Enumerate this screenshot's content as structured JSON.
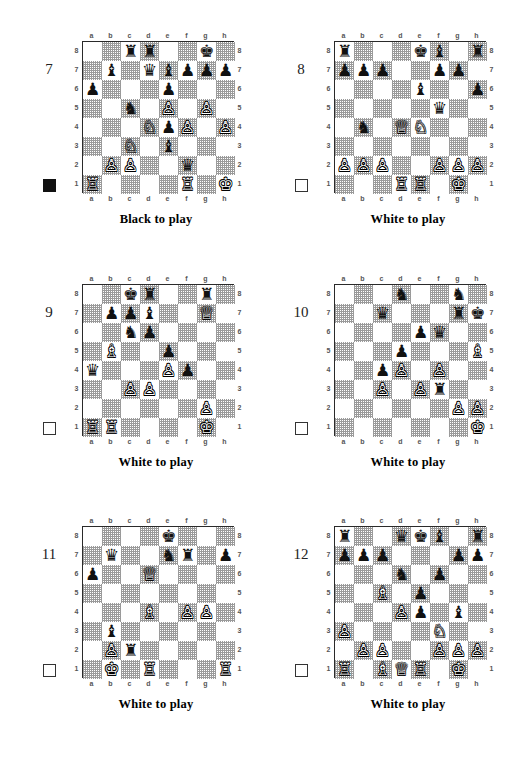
{
  "page": {
    "files": [
      "a",
      "b",
      "c",
      "d",
      "e",
      "f",
      "g",
      "h"
    ],
    "ranks": [
      "8",
      "7",
      "6",
      "5",
      "4",
      "3",
      "2",
      "1"
    ],
    "piece_glyphs": {
      "wK": "♔",
      "wQ": "♕",
      "wR": "♖",
      "wB": "♗",
      "wN": "♘",
      "wP": "♙",
      "bK": "♚",
      "bQ": "♛",
      "bR": "♜",
      "bB": "♝",
      "bN": "♞",
      "bP": "♟"
    },
    "colors": {
      "light_square": "#ffffff",
      "dark_square": "#9a9a9a",
      "border": "#2a2a2a",
      "text": "#000000"
    }
  },
  "diagrams": [
    {
      "number": "7",
      "caption": "Black to play",
      "turn": "black",
      "turn_indicator": "filled-black-square",
      "position": [
        [
          "",
          "",
          "bR",
          "bR",
          "",
          "",
          "bK",
          ""
        ],
        [
          "",
          "bB",
          "",
          "bQ",
          "bB",
          "bP",
          "bP",
          "bP"
        ],
        [
          "bP",
          "",
          "",
          "",
          "bP",
          "",
          "",
          ""
        ],
        [
          "",
          "",
          "bN",
          "",
          "wP",
          "",
          "wP",
          ""
        ],
        [
          "",
          "",
          "",
          "wN",
          "bP",
          "wP",
          "",
          "wP"
        ],
        [
          "",
          "",
          "wN",
          "",
          "bB",
          "",
          "",
          ""
        ],
        [
          "",
          "wP",
          "wP",
          "",
          "",
          "bQ",
          "",
          ""
        ],
        [
          "wR",
          "",
          "",
          "",
          "",
          "wR",
          "",
          "wK"
        ]
      ]
    },
    {
      "number": "8",
      "caption": "White to play",
      "turn": "white",
      "turn_indicator": "empty-white-square",
      "position": [
        [
          "bR",
          "",
          "",
          "",
          "bK",
          "bB",
          "",
          "bR"
        ],
        [
          "bP",
          "bP",
          "bP",
          "",
          "",
          "bP",
          "bP",
          ""
        ],
        [
          "",
          "",
          "",
          "",
          "bB",
          "",
          "",
          "bP"
        ],
        [
          "",
          "",
          "",
          "",
          "",
          "bQ",
          "",
          ""
        ],
        [
          "",
          "bN",
          "",
          "wQ",
          "wN",
          "",
          "",
          ""
        ],
        [
          "",
          "",
          "",
          "",
          "",
          "",
          "",
          ""
        ],
        [
          "wP",
          "wP",
          "wP",
          "",
          "",
          "wP",
          "wP",
          "wP"
        ],
        [
          "",
          "",
          "",
          "wR",
          "wR",
          "",
          "wK",
          ""
        ]
      ]
    },
    {
      "number": "9",
      "caption": "White to play",
      "turn": "white",
      "turn_indicator": "empty-white-square",
      "position": [
        [
          "",
          "",
          "bK",
          "bR",
          "",
          "",
          "bR",
          ""
        ],
        [
          "",
          "bP",
          "bP",
          "bB",
          "",
          "",
          "wQ",
          ""
        ],
        [
          "",
          "",
          "bN",
          "bP",
          "",
          "",
          "",
          ""
        ],
        [
          "",
          "wB",
          "",
          "",
          "bP",
          "",
          "",
          ""
        ],
        [
          "bQ",
          "",
          "",
          "",
          "wP",
          "bP",
          "",
          ""
        ],
        [
          "",
          "",
          "wP",
          "wP",
          "",
          "",
          "",
          ""
        ],
        [
          "",
          "",
          "",
          "",
          "",
          "",
          "wP",
          ""
        ],
        [
          "wR",
          "wR",
          "",
          "",
          "",
          "",
          "wK",
          ""
        ]
      ]
    },
    {
      "number": "10",
      "caption": "White to play",
      "turn": "white",
      "turn_indicator": "empty-white-square",
      "position": [
        [
          "",
          "",
          "",
          "bN",
          "",
          "",
          "bN",
          ""
        ],
        [
          "",
          "",
          "bQ",
          "",
          "",
          "",
          "bR",
          "bK"
        ],
        [
          "",
          "",
          "",
          "",
          "bP",
          "bQ",
          "",
          ""
        ],
        [
          "",
          "",
          "",
          "bP",
          "",
          "",
          "",
          "wB"
        ],
        [
          "",
          "",
          "bP",
          "wP",
          "",
          "wP",
          "",
          ""
        ],
        [
          "",
          "",
          "wP",
          "",
          "wP",
          "bR",
          "",
          ""
        ],
        [
          "",
          "",
          "",
          "",
          "",
          "",
          "wP",
          "wP"
        ],
        [
          "",
          "",
          "",
          "",
          "",
          "",
          "",
          "wK"
        ]
      ]
    },
    {
      "number": "11",
      "caption": "White to play",
      "turn": "white",
      "turn_indicator": "empty-white-square",
      "position": [
        [
          "",
          "",
          "",
          "",
          "bK",
          "",
          "",
          ""
        ],
        [
          "",
          "bQ",
          "",
          "",
          "bN",
          "bR",
          "",
          "bP"
        ],
        [
          "bP",
          "",
          "",
          "wQ",
          "",
          "",
          "",
          ""
        ],
        [
          "",
          "",
          "",
          "",
          "",
          "",
          "",
          ""
        ],
        [
          "",
          "",
          "",
          "wB",
          "",
          "wP",
          "wP",
          ""
        ],
        [
          "",
          "bB",
          "",
          "",
          "",
          "",
          "",
          ""
        ],
        [
          "",
          "wP",
          "bR",
          "",
          "",
          "",
          "",
          ""
        ],
        [
          "",
          "wK",
          "",
          "wR",
          "",
          "",
          "",
          "wR"
        ]
      ]
    },
    {
      "number": "12",
      "caption": "White to play",
      "turn": "white",
      "turn_indicator": "empty-white-square",
      "position": [
        [
          "bR",
          "",
          "",
          "bQ",
          "bK",
          "bB",
          "",
          "bR"
        ],
        [
          "bP",
          "bP",
          "bP",
          "",
          "",
          "",
          "bP",
          "bP"
        ],
        [
          "",
          "",
          "",
          "bN",
          "",
          "bP",
          "",
          ""
        ],
        [
          "",
          "",
          "wB",
          "",
          "bP",
          "",
          "",
          ""
        ],
        [
          "",
          "",
          "",
          "wP",
          "bP",
          "",
          "bB",
          ""
        ],
        [
          "wP",
          "",
          "",
          "",
          "",
          "wN",
          "",
          ""
        ],
        [
          "",
          "wP",
          "wP",
          "",
          "",
          "wP",
          "wP",
          "wP"
        ],
        [
          "wR",
          "",
          "wB",
          "wQ",
          "wR",
          "",
          "wK",
          ""
        ]
      ]
    }
  ]
}
